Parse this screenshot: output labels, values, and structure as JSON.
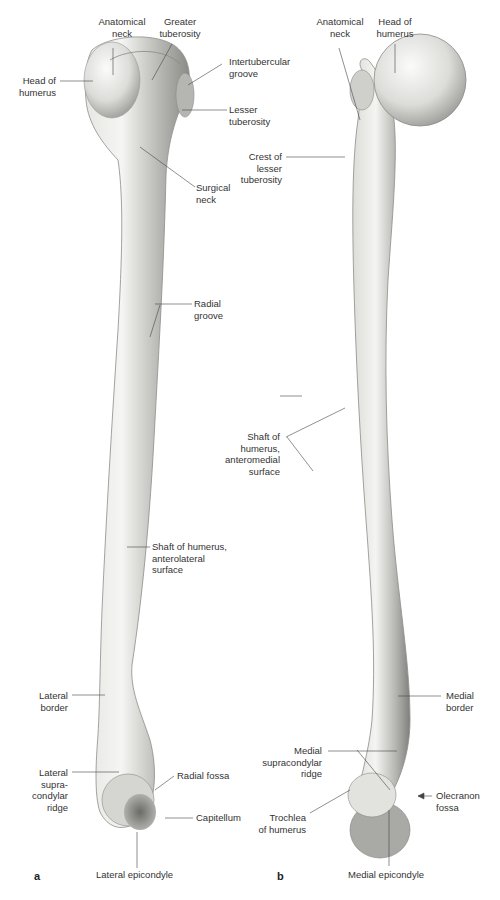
{
  "figure": {
    "panels": [
      {
        "id": "a",
        "letter": "a",
        "labels": {
          "anatomical_neck": [
            "Anatomical",
            "neck"
          ],
          "greater_tuberosity": [
            "Greater",
            "tuberosity"
          ],
          "head_of_humerus": [
            "Head of",
            "humerus"
          ],
          "intertubercular_groove": [
            "Intertubercular",
            "groove"
          ],
          "lesser_tuberosity": [
            "Lesser",
            "tuberosity"
          ],
          "surgical_neck": [
            "Surgical",
            "neck"
          ],
          "radial_groove": [
            "Radial",
            "groove"
          ],
          "shaft": [
            "Shaft of humerus,",
            "anterolateral",
            "surface"
          ],
          "lateral_border": [
            "Lateral",
            "border"
          ],
          "lateral_supracondylar_ridge": [
            "Lateral",
            "supra-",
            "condylar",
            "ridge"
          ],
          "radial_fossa": [
            "Radial fossa"
          ],
          "capitellum": [
            "Capitellum"
          ],
          "lateral_epicondyle": [
            "Lateral epicondyle"
          ]
        }
      },
      {
        "id": "b",
        "letter": "b",
        "labels": {
          "anatomical_neck": [
            "Anatomical",
            "neck"
          ],
          "head_of_humerus": [
            "Head of",
            "humerus"
          ],
          "crest_of_lesser_tuberosity": [
            "Crest of",
            "lesser",
            "tuberosity"
          ],
          "shaft": [
            "Shaft of",
            "humerus,",
            "anteromedial",
            "surface"
          ],
          "medial_border": [
            "Medial",
            "border"
          ],
          "medial_supracondylar_ridge": [
            "Medial",
            "supracondylar",
            "ridge"
          ],
          "olecranon_fossa": [
            "Olecranon",
            "fossa"
          ],
          "trochlea": [
            "Trochlea",
            "of humerus"
          ],
          "medial_epicondyle": [
            "Medial epicondyle"
          ]
        }
      }
    ],
    "colors": {
      "bone_light": "#f2f2f0",
      "bone_mid": "#c9c9c6",
      "bone_dark": "#7d7d7a",
      "leader": "#444444"
    }
  }
}
